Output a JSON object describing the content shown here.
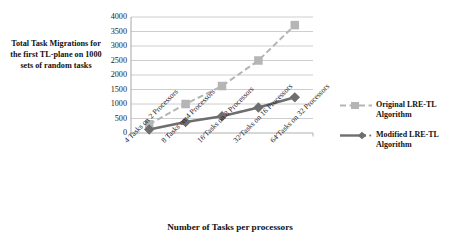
{
  "chart_data": {
    "type": "line",
    "title": "",
    "xlabel": "Number of  Tasks per processors",
    "ylabel": "Total Task Migrations for the first TL-plane on 1000 sets of random tasks",
    "categories": [
      "4 Tasks on 2 Processors",
      "8 Tasks on 4 Processors",
      "16 Tasks on 8 Processors",
      "32 Tasks on 16 Processors",
      "64 Tasks on 32 Processors"
    ],
    "series": [
      {
        "name": "Original LRE-TL Algorithm",
        "values": [
          300,
          1000,
          1620,
          2500,
          3720
        ],
        "color": "#b5b5b5",
        "marker": "square",
        "line_style": "dashed"
      },
      {
        "name": "Modified LRE-TL Algorithm",
        "values": [
          120,
          380,
          580,
          880,
          1230
        ],
        "color": "#6e6e6e",
        "marker": "diamond",
        "line_style": "solid"
      }
    ],
    "ylim": [
      0,
      4000
    ],
    "y_ticks": [
      0,
      500,
      1000,
      1500,
      2000,
      2500,
      3000,
      3500,
      4000
    ],
    "grid": true,
    "legend_position": "right"
  },
  "legend": {
    "items": [
      {
        "label_line1": "Original LRE-TL",
        "label_line2": "Algorithm"
      },
      {
        "label_line1": "Modified LRE-TL",
        "label_line2": "Algorithm"
      }
    ]
  },
  "colors": {
    "gridline": "#c8c8c8",
    "axis": "#a6a6a6",
    "series_original": "#b5b5b5",
    "series_modified": "#6e6e6e",
    "text": "#222222"
  }
}
